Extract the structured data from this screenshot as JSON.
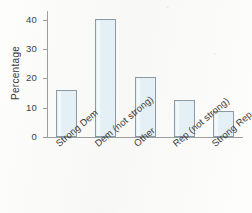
{
  "figure": {
    "background_color": "#fdfdfc",
    "bar_fill_color": "#e4f0f6",
    "bar_border_color": "#8b9ba6",
    "axis_color": "#9d9d9d",
    "text_color": "#3a3a3a"
  },
  "chart_data": {
    "type": "bar",
    "title": "",
    "subtitle": "",
    "xlabel": "",
    "ylabel": "Percentage",
    "categories": [
      "Strong Dem",
      "Dem (not strong)",
      "Other",
      "Rep (not strong)",
      "Strong Rep"
    ],
    "values": [
      16.0,
      40.3,
      20.5,
      12.7,
      9.0
    ],
    "ylim": [
      0,
      43
    ],
    "yticks": [
      0,
      10,
      20,
      30,
      40
    ],
    "ytick_labels": [
      "0",
      "10",
      "20",
      "30",
      "40"
    ],
    "grid": false,
    "legend": null,
    "annotations": []
  }
}
